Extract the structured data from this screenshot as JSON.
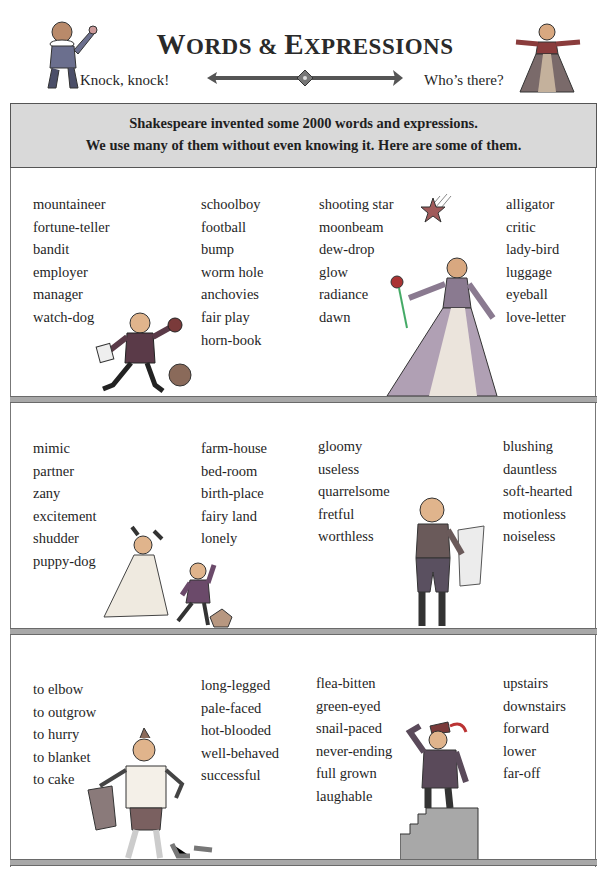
{
  "header": {
    "title_first": "W",
    "title_rest1": "ORDS & ",
    "title_second": "E",
    "title_rest2": "XPRESSIONS",
    "title_full": "Words & Expressions",
    "left_caption": "Knock, knock!",
    "right_caption": "Who’s there?"
  },
  "intro": {
    "line1": "Shakespeare invented some 2000 words and expressions.",
    "line2": "We use many of them without even knowing it. Here are some of them."
  },
  "sections": [
    {
      "columns": [
        [
          "mountaineer",
          "fortune-teller",
          "bandit",
          "employer",
          "manager",
          "watch-dog"
        ],
        [
          "schoolboy",
          "football",
          "bump",
          "worm hole",
          "anchovies",
          "fair play",
          "horn-book"
        ],
        [
          "shooting star",
          "moonbeam",
          "dew-drop",
          "glow",
          "radiance",
          "dawn"
        ],
        [
          "alligator",
          "critic",
          "lady-bird",
          "luggage",
          "eyeball",
          "love-letter"
        ]
      ]
    },
    {
      "columns": [
        [
          "mimic",
          "partner",
          "zany",
          "excitement",
          "shudder",
          "puppy-dog"
        ],
        [
          "farm-house",
          "bed-room",
          "birth-place",
          "fairy land",
          "lonely"
        ],
        [
          "gloomy",
          "useless",
          "quarrelsome",
          "fretful",
          "worthless"
        ],
        [
          "blushing",
          "dauntless",
          "soft-hearted",
          "motionless",
          "noiseless"
        ]
      ]
    },
    {
      "columns": [
        [
          "to elbow",
          "to outgrow",
          "to hurry",
          "to blanket",
          "to cake"
        ],
        [
          "long-legged",
          "pale-faced",
          "hot-blooded",
          "well-behaved",
          "successful"
        ],
        [
          "flea-bitten",
          "green-eyed",
          "snail-paced",
          "never-ending",
          "full grown",
          "laughable"
        ],
        [
          "upstairs",
          "downstairs",
          "forward",
          "lower",
          "far-off"
        ]
      ]
    }
  ],
  "illustrations": {
    "header_left": "man-in-ruff-knocking",
    "header_right": "woman-in-gown",
    "section1_left": "running-schoolboy-with-ball",
    "section1_right": "lady-with-flower-and-shooting-star",
    "section2_left": "dancing-couple-with-puppy",
    "section2_right": "man-reading-scroll",
    "section3_left": "man-undressing",
    "section3_right": "man-on-stairs-looking-far"
  }
}
